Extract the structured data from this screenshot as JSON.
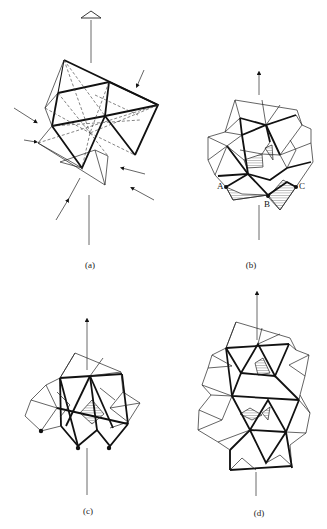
{
  "figure": {
    "type": "crystallographic polyhedral diagram",
    "panels": [
      {
        "id": "a",
        "label": "(a)",
        "features": [
          "vertical axis with triangle arrowhead at top",
          "octahedral cluster with dashed hidden edges",
          "inward-pointing arrows around cluster"
        ]
      },
      {
        "id": "b",
        "label": "(b)",
        "features": [
          "vertical axis arrow",
          "polyhedral cluster",
          "hatched faces at base"
        ],
        "point_labels": [
          "A",
          "B",
          "C"
        ]
      },
      {
        "id": "c",
        "label": "(c)",
        "features": [
          "vertical axis arrow",
          "polyhedral cluster",
          "hatched central face",
          "three black vertex dots at base"
        ]
      },
      {
        "id": "d",
        "label": "(d)",
        "features": [
          "vertical axis arrow",
          "elongated stacked polyhedral cluster",
          "hatched faces"
        ]
      }
    ]
  },
  "labels": {
    "a": "(a)",
    "b": "(b)",
    "c": "(c)",
    "d": "(d)",
    "A": "A",
    "B": "B",
    "C": "C"
  },
  "colors": {
    "line": "#111111",
    "background": "#ffffff"
  }
}
